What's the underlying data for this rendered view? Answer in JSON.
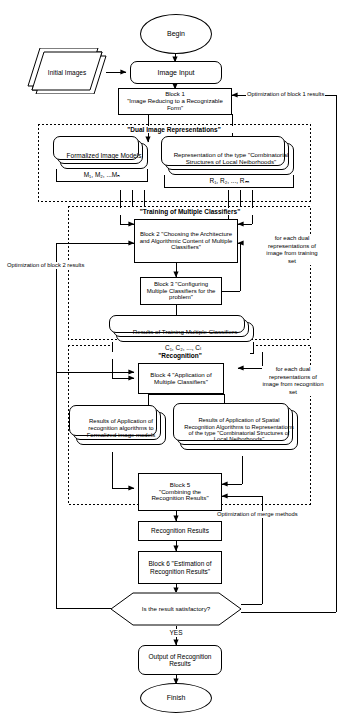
{
  "diagram": {
    "type": "flowchart"
  },
  "nodes": {
    "begin": "Begin",
    "initial_images": "Initial Images",
    "image_input": "Image Input",
    "block1_line1": "Block 1",
    "block1_line2": "\"Image Reducing to a Recognizable Form\"",
    "formalized_models": "Formalized Image Models",
    "formalized_models_sub": "M₁, M₂, ...Mₙ",
    "representation": "Representation of the type \"Combinatorial Structures of Local Neiborhoods\"",
    "representation_sub": "R₁, R₂, ..., Rₘ",
    "block2": "Block 2 \"Choosing the Architecture and Algorithmic Content of Multiple Classifiers\"",
    "block3": "Block 3 \"Configuring Multiple Classifiers for the problem\"",
    "training_results": "Results of Training Multiple Classifiers",
    "training_results_sub": "C₁, C₂, ..., Cₗ",
    "block4": "Block 4 \"Application of Multiple Classifiers\"",
    "results_left": "Results of Application of recognition algorithms to Formalized image models",
    "results_right": "Results of Application of Spatial Recognition Algorithms to Representations of the type \"Combinatorial Structures of Local Neiborhoods\"",
    "block5_line1": "Block 5",
    "block5_line2": "\"Combining the Recognition Results\"",
    "recognition_results": "Recognition Results",
    "block6": "Block 6 \"Estimation of Recognition Results\"",
    "decision": "Is the result satisfactory?",
    "output": "Output of Recognition Results",
    "finish": "Finish"
  },
  "group_labels": {
    "dual": "\"Dual Image Representations\"",
    "training": "\"Training of Multiple Classifiers\"",
    "recognition": "\"Recognition\""
  },
  "side_notes": {
    "training_set": "for each dual representations of image from training set",
    "recognition_set": "for each dual representations of image from recognition set"
  },
  "edge_labels": {
    "opt_block1": "Optimization of block 1 results",
    "opt_block2": "Optimization of block 2 results",
    "opt_merge": "Optimization of merge methods",
    "yes": "YES"
  },
  "colors": {
    "stroke": "#000000",
    "background": "#ffffff",
    "dashed_group": "#000000"
  }
}
